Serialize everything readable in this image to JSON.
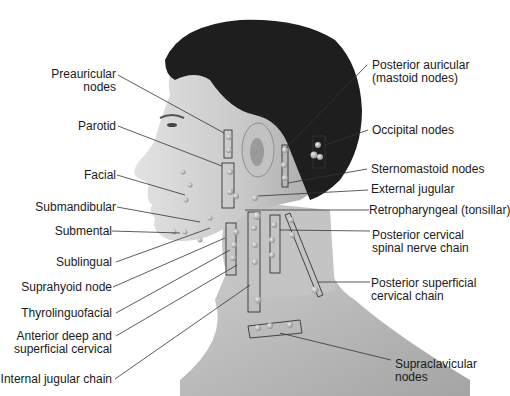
{
  "figure": {
    "colors": {
      "background": "#ffffff",
      "skin_light": "#d8d8d8",
      "skin_mid": "#a9a9a9",
      "hair": "#1c1c1c",
      "leader_line": "#333333",
      "text": "#1a1a1a"
    }
  },
  "labels_left": [
    {
      "id": "preauricular",
      "lines": [
        "Preauricular",
        "nodes"
      ]
    },
    {
      "id": "parotid",
      "lines": [
        "Parotid"
      ]
    },
    {
      "id": "facial",
      "lines": [
        "Facial"
      ]
    },
    {
      "id": "submandibular",
      "lines": [
        "Submandibular"
      ]
    },
    {
      "id": "submental",
      "lines": [
        "Submental"
      ]
    },
    {
      "id": "sublingual",
      "lines": [
        "Sublingual"
      ]
    },
    {
      "id": "suprahyoid",
      "lines": [
        "Suprahyoid node"
      ]
    },
    {
      "id": "thyrolinguofacial",
      "lines": [
        "Thyrolinguofacial"
      ]
    },
    {
      "id": "anterior-deep",
      "lines": [
        "Anterior deep and",
        "superficial cervical"
      ]
    },
    {
      "id": "internal-jugular",
      "lines": [
        "Internal jugular chain"
      ]
    }
  ],
  "labels_right": [
    {
      "id": "posterior-auricular",
      "lines": [
        "Posterior auricular",
        "(mastoid nodes)"
      ]
    },
    {
      "id": "occipital",
      "lines": [
        "Occipital nodes"
      ]
    },
    {
      "id": "sternomastoid",
      "lines": [
        "Sternomastoid nodes"
      ]
    },
    {
      "id": "external-jugular",
      "lines": [
        "External jugular"
      ]
    },
    {
      "id": "retropharyngeal",
      "lines": [
        "Retropharyngeal (tonsillar)"
      ]
    },
    {
      "id": "posterior-cervical",
      "lines": [
        "Posterior cervical",
        "spinal nerve chain"
      ]
    },
    {
      "id": "posterior-superficial",
      "lines": [
        "Posterior superficial",
        "cervical chain"
      ]
    },
    {
      "id": "supraclavicular",
      "lines": [
        "Supraclavicular",
        "nodes"
      ]
    }
  ]
}
